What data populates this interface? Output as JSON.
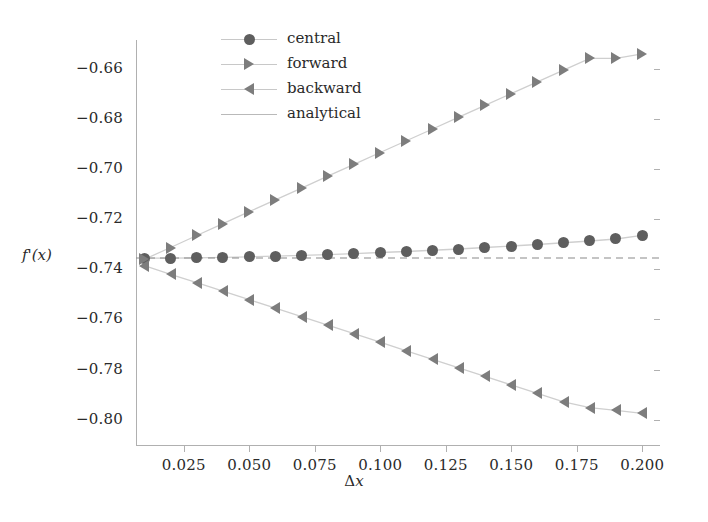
{
  "axes": {
    "ylabel": "f'(x)",
    "xlabel_symbol": "Δ",
    "xlabel_var": "x",
    "yticks": [
      "-0.66",
      "-0.68",
      "-0.70",
      "-0.72",
      "-0.74",
      "-0.76",
      "-0.78",
      "-0.80"
    ],
    "ytick_values": [
      -0.66,
      -0.68,
      -0.7,
      -0.72,
      -0.74,
      -0.76,
      -0.78,
      -0.8
    ],
    "xticks": [
      "0.025",
      "0.050",
      "0.075",
      "0.100",
      "0.125",
      "0.150",
      "0.175",
      "0.200"
    ],
    "xtick_values": [
      0.025,
      0.05,
      0.075,
      0.1,
      0.125,
      0.15,
      0.175,
      0.2
    ]
  },
  "legend": {
    "items": [
      {
        "label": "central",
        "marker": "circle-marker",
        "color": "#5e5e5e"
      },
      {
        "label": "forward",
        "marker": "triangle-right-marker",
        "color": "#7d7d7d"
      },
      {
        "label": "backward",
        "marker": "triangle-left-marker",
        "color": "#7d7d7d"
      },
      {
        "label": "analytical",
        "marker": "line-marker",
        "color": "#b9b9b9"
      }
    ]
  },
  "chart_data": {
    "type": "line",
    "title": "",
    "xlabel": "Δx",
    "ylabel": "f'(x)",
    "xlim": [
      0.0068,
      0.2068
    ],
    "ylim": [
      -0.8105,
      -0.6485
    ],
    "grid": false,
    "legend_position": "upper-center-left",
    "x": [
      0.01,
      0.02,
      0.03,
      0.04,
      0.05,
      0.06,
      0.07,
      0.08,
      0.09,
      0.1,
      0.11,
      0.12,
      0.13,
      0.14,
      0.15,
      0.16,
      0.17,
      0.18,
      0.19,
      0.2
    ],
    "series": [
      {
        "name": "central",
        "marker": "circle",
        "color": "#5e5e5e",
        "linestyle": "solid",
        "values": [
          -0.7355,
          -0.7355,
          -0.7354,
          -0.7352,
          -0.735,
          -0.7347,
          -0.7344,
          -0.7341,
          -0.7337,
          -0.7333,
          -0.7329,
          -0.7324,
          -0.7319,
          -0.7313,
          -0.7307,
          -0.7301,
          -0.7294,
          -0.7287,
          -0.7279,
          -0.7265
        ]
      },
      {
        "name": "forward",
        "marker": "triangle-right",
        "color": "#7d7d7d",
        "linestyle": "solid",
        "values": [
          -0.736,
          -0.7313,
          -0.7265,
          -0.7218,
          -0.717,
          -0.7123,
          -0.7076,
          -0.7028,
          -0.6981,
          -0.6934,
          -0.6887,
          -0.684,
          -0.6793,
          -0.6746,
          -0.6699,
          -0.6652,
          -0.6605,
          -0.6558,
          -0.6558,
          -0.654
        ]
      },
      {
        "name": "backward",
        "marker": "triangle-left",
        "color": "#7d7d7d",
        "linestyle": "solid",
        "values": [
          -0.7385,
          -0.742,
          -0.7453,
          -0.7487,
          -0.7521,
          -0.7555,
          -0.7589,
          -0.7623,
          -0.7657,
          -0.7691,
          -0.7725,
          -0.7759,
          -0.7793,
          -0.7827,
          -0.7861,
          -0.7895,
          -0.7929,
          -0.7952,
          -0.7963,
          -0.7975
        ]
      },
      {
        "name": "analytical",
        "marker": "none",
        "color": "#8a8a8a",
        "linestyle": "dashed",
        "constant_value": -0.7355
      }
    ]
  }
}
